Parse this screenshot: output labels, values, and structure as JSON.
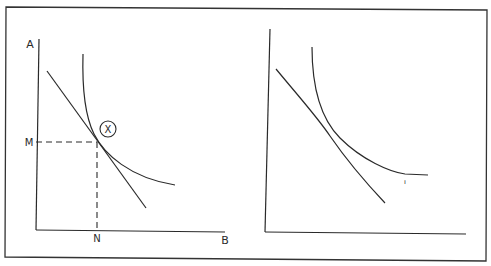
{
  "figure": {
    "type": "diagram",
    "colors": {
      "line": "#2a2a2a",
      "background": "#ffffff",
      "frame": "#333333"
    }
  },
  "left_panel": {
    "y_axis_label": "A",
    "x_axis_label": "B",
    "y_marker_label": "M",
    "x_marker_label": "N",
    "tangency_marker": "X",
    "elements": [
      "indifference-curve",
      "budget-line",
      "tangency-point",
      "dashed-guide-M",
      "dashed-guide-N"
    ]
  },
  "right_panel": {
    "y_axis_label": "",
    "x_axis_label": "",
    "curve_mark": "ı",
    "elements": [
      "indifference-curve",
      "budget-line"
    ]
  }
}
